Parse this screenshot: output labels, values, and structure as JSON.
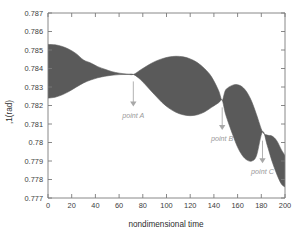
{
  "chart_data": {
    "type": "area",
    "title": "",
    "subtitle": "",
    "xlabel": "nondimensional time",
    "ylabel": "(rad)",
    "ylabel_raw": ",1(rad)",
    "xlim": [
      0,
      200
    ],
    "ylim": [
      0.777,
      0.787
    ],
    "xticks": [
      0,
      20,
      40,
      60,
      80,
      100,
      120,
      140,
      160,
      180,
      200
    ],
    "xtick_labels": [
      "0",
      "20",
      "40",
      "60",
      "80",
      "100",
      "120",
      "140",
      "160",
      "180",
      "200"
    ],
    "yticks": [
      0.777,
      0.778,
      0.779,
      0.78,
      0.781,
      0.782,
      0.783,
      0.784,
      0.785,
      0.786,
      0.787
    ],
    "ytick_labels": [
      "0.777",
      "0.778",
      "0.779",
      "0.78",
      "0.781",
      "0.782",
      "0.783",
      "0.784",
      "0.785",
      "0.786",
      "0.787"
    ],
    "grid": false,
    "legend": "none",
    "band_color": "#5a5a5a",
    "series": [
      {
        "name": "envelope-upper",
        "x": [
          0,
          6,
          12,
          18,
          24,
          30,
          36,
          42,
          48,
          54,
          60,
          66,
          72,
          78,
          84,
          90,
          96,
          102,
          108,
          114,
          120,
          126,
          132,
          138,
          144,
          147,
          150,
          156,
          160,
          164,
          168,
          172,
          176,
          181,
          185,
          189,
          193,
          197,
          200
        ],
        "values": [
          0.7853,
          0.78528,
          0.78519,
          0.78503,
          0.78479,
          0.78446,
          0.7843,
          0.7841,
          0.78396,
          0.78383,
          0.78375,
          0.7837,
          0.78368,
          0.78392,
          0.78416,
          0.78437,
          0.78452,
          0.78462,
          0.78466,
          0.78463,
          0.78452,
          0.78432,
          0.784,
          0.78355,
          0.7828,
          0.78228,
          0.78285,
          0.7831,
          0.78312,
          0.783,
          0.7827,
          0.7822,
          0.7815,
          0.78058,
          0.7804,
          0.78035,
          0.7801,
          0.7796,
          0.7793
        ]
      },
      {
        "name": "envelope-lower",
        "x": [
          0,
          6,
          12,
          18,
          24,
          30,
          36,
          42,
          48,
          54,
          60,
          66,
          72,
          78,
          84,
          90,
          96,
          102,
          108,
          114,
          120,
          126,
          132,
          138,
          144,
          147,
          150,
          156,
          160,
          164,
          168,
          172,
          176,
          181,
          185,
          189,
          193,
          197,
          200
        ],
        "values": [
          0.7824,
          0.78245,
          0.78258,
          0.78277,
          0.783,
          0.78322,
          0.78338,
          0.7835,
          0.78358,
          0.78364,
          0.78367,
          0.78368,
          0.78368,
          0.7834,
          0.783,
          0.78258,
          0.78218,
          0.78186,
          0.78163,
          0.7815,
          0.78145,
          0.7815,
          0.78165,
          0.7819,
          0.78215,
          0.78228,
          0.7815,
          0.7804,
          0.77975,
          0.7793,
          0.77905,
          0.779,
          0.7793,
          0.78058,
          0.77985,
          0.779,
          0.7783,
          0.77775,
          0.7776
        ]
      }
    ],
    "nodes": [
      {
        "label": "point A",
        "x": 72,
        "y": 0.78368
      },
      {
        "label": "point B",
        "x": 147,
        "y": 0.78228
      },
      {
        "label": "point C",
        "x": 181,
        "y": 0.78058
      }
    ],
    "annotations": [
      {
        "name": "point-a",
        "label": "point A",
        "x": 72,
        "arrow_from_y": 0.7833,
        "arrow_to_y": 0.78195,
        "text_x": 72,
        "text_y": 0.78135,
        "anchor": "middle"
      },
      {
        "name": "point-b",
        "label": "point B",
        "x": 147,
        "arrow_from_y": 0.7819,
        "arrow_to_y": 0.78068,
        "text_x": 147,
        "text_y": 0.78008,
        "anchor": "middle"
      },
      {
        "name": "point-c",
        "label": "point C",
        "x": 181,
        "arrow_from_y": 0.7801,
        "arrow_to_y": 0.77888,
        "text_x": 181,
        "text_y": 0.77828,
        "anchor": "middle"
      }
    ]
  }
}
